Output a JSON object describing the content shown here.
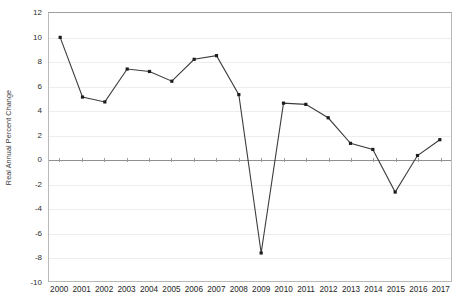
{
  "chart_data": {
    "type": "line",
    "title": "",
    "xlabel": "",
    "ylabel": "Real Annual Percent Change",
    "categories": [
      "2000",
      "2001",
      "2002",
      "2003",
      "2004",
      "2005",
      "2006",
      "2007",
      "2008",
      "2009",
      "2010",
      "2011",
      "2012",
      "2013",
      "2014",
      "2015",
      "2016",
      "2017"
    ],
    "values": [
      10.0,
      5.1,
      4.7,
      7.4,
      7.2,
      6.4,
      8.2,
      8.5,
      5.3,
      -7.7,
      4.6,
      4.5,
      3.4,
      1.3,
      0.8,
      -2.7,
      0.3,
      1.6
    ],
    "series": [
      {
        "name": "Real Annual Percent Change",
        "values": [
          10.0,
          5.1,
          4.7,
          7.4,
          7.2,
          6.4,
          8.2,
          8.5,
          5.3,
          -7.7,
          4.6,
          4.5,
          3.4,
          1.3,
          0.8,
          -2.7,
          0.3,
          1.6
        ]
      }
    ],
    "ylim": [
      -10,
      12
    ],
    "yticks": [
      12,
      10,
      8,
      6,
      4,
      2,
      0,
      -2,
      -4,
      -6,
      -8,
      -10
    ],
    "ytick_labels": [
      "12",
      "10",
      "8",
      "6",
      "4",
      "2",
      "0",
      "-2",
      "-4",
      "-6",
      "-8",
      "-10"
    ],
    "grid": true,
    "grid_axis": "y",
    "legend": false,
    "legend_position": "none",
    "marker": "square",
    "line_color": "#3c3c3c",
    "marker_color": "#1c1c1c",
    "gridline_color": "#ededed",
    "zeroline_color": "#8f8f8f",
    "plot_border_color": "#b9b9b9",
    "background_color": "#ffffff"
  }
}
